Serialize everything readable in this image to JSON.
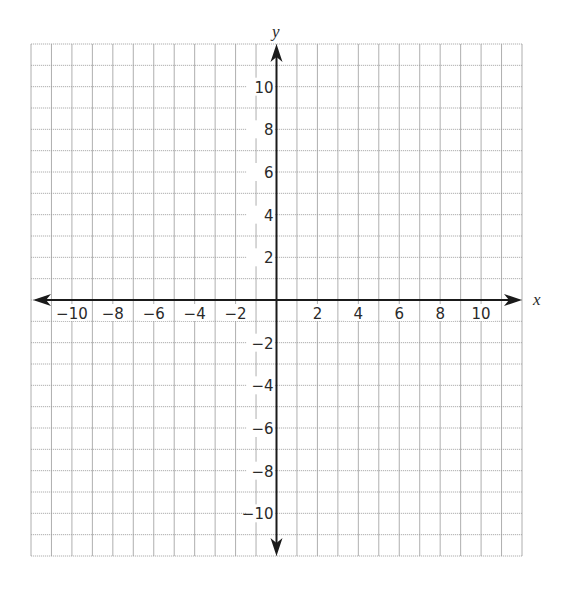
{
  "chart_data": {
    "type": "scatter",
    "title": "",
    "xlabel": "x",
    "ylabel": "y",
    "xlim": [
      -12,
      12
    ],
    "ylim": [
      -12,
      12
    ],
    "grid": true,
    "grid_step": 1,
    "x_ticks": [
      -10,
      -8,
      -6,
      -4,
      -2,
      2,
      4,
      6,
      8,
      10
    ],
    "y_ticks": [
      10,
      8,
      6,
      4,
      2,
      -2,
      -4,
      -6,
      -8,
      -10
    ],
    "x_tick_labels": [
      "−10",
      "−8",
      "−6",
      "−4",
      "−2",
      "2",
      "4",
      "6",
      "8",
      "10"
    ],
    "y_tick_labels": [
      "10",
      "8",
      "6",
      "4",
      "2",
      "−2",
      "−4",
      "−6",
      "−8",
      "−10"
    ],
    "series": [],
    "axes_arrows": true
  },
  "layout": {
    "grid_left": 31,
    "grid_right": 522,
    "grid_top": 44,
    "grid_bottom": 556,
    "origin_x": 277,
    "origin_y": 299,
    "cells": 24
  },
  "colors": {
    "grid": "#9a9a9a",
    "axis": "#1a1a1a",
    "text": "#2a2a2a",
    "background": "#ffffff"
  }
}
